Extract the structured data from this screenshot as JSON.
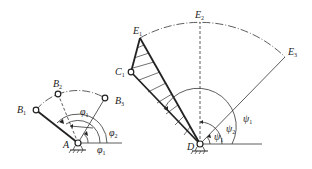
{
  "figure": {
    "left_mechanism": {
      "pivot_label": "A",
      "points": [
        {
          "name": "B",
          "sub": "1"
        },
        {
          "name": "B",
          "sub": "2"
        },
        {
          "name": "B",
          "sub": "3"
        }
      ],
      "angles": [
        {
          "name": "φ",
          "sub": "1",
          "position": "top"
        },
        {
          "name": "φ",
          "sub": "2",
          "position": "right"
        },
        {
          "name": "φ",
          "sub": "1",
          "position": "bottom"
        }
      ]
    },
    "right_mechanism": {
      "pivot_label": "D",
      "points": [
        {
          "name": "E",
          "sub": "1"
        },
        {
          "name": "E",
          "sub": "2"
        },
        {
          "name": "E",
          "sub": "3"
        },
        {
          "name": "C",
          "sub": "1"
        }
      ],
      "angles": [
        {
          "name": "ψ",
          "sub": "1",
          "position": "outer"
        },
        {
          "name": "ψ",
          "sub": "2",
          "position": "middle"
        },
        {
          "name": "ψ",
          "sub": "1",
          "position": "inner"
        }
      ]
    }
  }
}
